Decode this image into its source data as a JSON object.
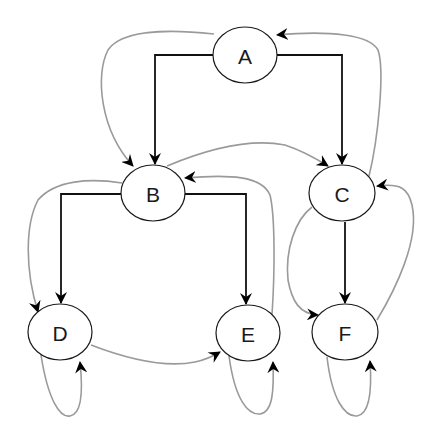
{
  "diagram": {
    "type": "directed-graph",
    "nodes": [
      {
        "id": "A",
        "label": "A",
        "cx": 245,
        "cy": 55
      },
      {
        "id": "B",
        "label": "B",
        "cx": 153,
        "cy": 193
      },
      {
        "id": "C",
        "label": "C",
        "cx": 342,
        "cy": 193
      },
      {
        "id": "D",
        "label": "D",
        "cx": 60,
        "cy": 332
      },
      {
        "id": "E",
        "label": "E",
        "cx": 248,
        "cy": 333
      },
      {
        "id": "F",
        "label": "F",
        "cx": 345,
        "cy": 332
      }
    ],
    "tree_edges": [
      {
        "from": "A",
        "to": "B",
        "style": "black-orthogonal"
      },
      {
        "from": "A",
        "to": "C",
        "style": "black-orthogonal"
      },
      {
        "from": "B",
        "to": "D",
        "style": "black-orthogonal"
      },
      {
        "from": "B",
        "to": "E",
        "style": "black-orthogonal"
      },
      {
        "from": "C",
        "to": "F",
        "style": "black-straight"
      }
    ],
    "link_edges": [
      {
        "from": "A",
        "to": "B",
        "style": "gray-curve"
      },
      {
        "from": "C",
        "to": "A",
        "style": "gray-curve"
      },
      {
        "from": "B",
        "to": "C",
        "style": "gray-curve"
      },
      {
        "from": "B",
        "to": "D",
        "style": "gray-curve"
      },
      {
        "from": "E",
        "to": "B",
        "style": "gray-curve"
      },
      {
        "from": "D",
        "to": "E",
        "style": "gray-curve"
      },
      {
        "from": "C",
        "to": "F",
        "style": "gray-curve"
      },
      {
        "from": "F",
        "to": "C",
        "style": "gray-curve"
      },
      {
        "from": "D",
        "to": "D",
        "style": "gray-self-loop"
      },
      {
        "from": "E",
        "to": "E",
        "style": "gray-self-loop"
      },
      {
        "from": "F",
        "to": "F",
        "style": "gray-self-loop"
      }
    ],
    "colors": {
      "tree_edge": "#111111",
      "link_edge": "#9a9a9a",
      "node_stroke": "#1a1a1a",
      "background": "#ffffff"
    }
  }
}
